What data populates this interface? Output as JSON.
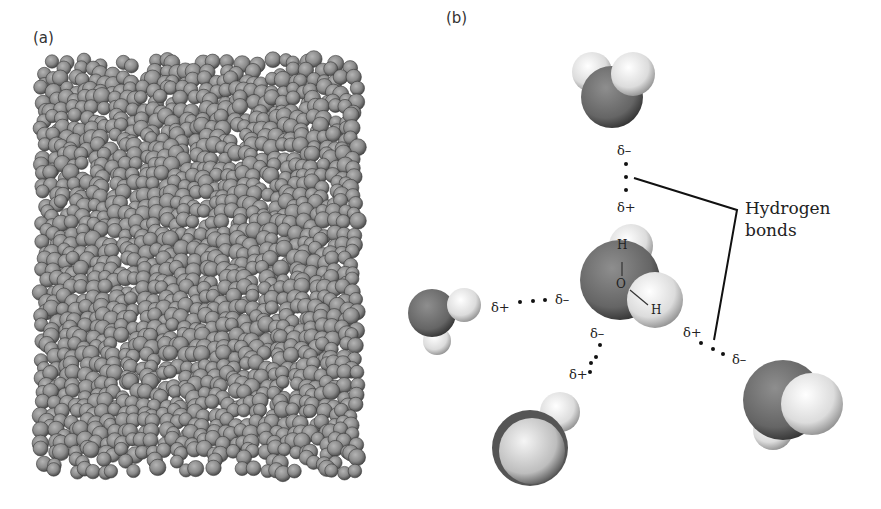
{
  "panels": {
    "a": {
      "label": "(a)",
      "description": "Simulation box of liquid water molecules (space-filling, grayscale)",
      "molecule_color": "#8a8a8a"
    },
    "b": {
      "label": "(b)",
      "description": "Central water molecule hydrogen-bonded to four neighbours",
      "annotation": [
        "Hydrogen",
        "bonds"
      ],
      "central_molecule": {
        "atoms": [
          "H",
          "O",
          "H"
        ]
      },
      "partial_charges": [
        {
          "id": "top-acceptor",
          "text": "δ–"
        },
        {
          "id": "top-donor",
          "text": "δ+"
        },
        {
          "id": "left-donor",
          "text": "δ+"
        },
        {
          "id": "left-acceptor",
          "text": "δ–"
        },
        {
          "id": "bottom-acceptor",
          "text": "δ–"
        },
        {
          "id": "bottom-donor",
          "text": "δ+"
        },
        {
          "id": "right-donor",
          "text": "δ+"
        },
        {
          "id": "right-acceptor",
          "text": "δ–"
        }
      ],
      "colors": {
        "oxygen": "#6e6e6e",
        "hydrogen": "#e6e6e6",
        "line": "#111111"
      }
    }
  }
}
